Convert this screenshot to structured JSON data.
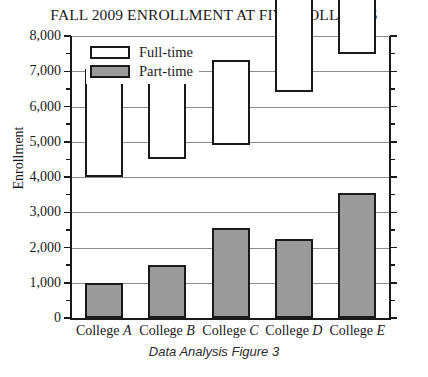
{
  "chart_data": {
    "type": "bar",
    "subtype": "stacked",
    "title": "FALL 2009 ENROLLMENT AT FIVE COLLEGES",
    "caption": "Data Analysis Figure 3",
    "xlabel": "",
    "ylabel": "Enrollment",
    "ylim": [
      0,
      8000
    ],
    "y_major_step": 1000,
    "y_minor_step": 500,
    "grid": "horizontal",
    "legend_position": "top-left inside plot",
    "categories": [
      "College A",
      "College B",
      "College C",
      "College D",
      "College E"
    ],
    "category_labels": [
      {
        "prefix": "College ",
        "italic_suffix": "A"
      },
      {
        "prefix": "College ",
        "italic_suffix": "B"
      },
      {
        "prefix": "College ",
        "italic_suffix": "C"
      },
      {
        "prefix": "College ",
        "italic_suffix": "D"
      },
      {
        "prefix": "College ",
        "italic_suffix": "E"
      }
    ],
    "series": [
      {
        "name": "Part-time",
        "color": "#9a9a9a",
        "values": [
          1000,
          1500,
          2550,
          2250,
          3550
        ]
      },
      {
        "name": "Full-time",
        "color": "#ffffff",
        "values": [
          3000,
          3000,
          2350,
          4150,
          3950
        ]
      }
    ],
    "totals": [
      4000,
      4500,
      4900,
      6400,
      7500
    ],
    "y_tick_labels": [
      "0",
      "1,000",
      "2,000",
      "3,000",
      "4,000",
      "5,000",
      "6,000",
      "7,000",
      "8,000"
    ],
    "y_tick_values": [
      0,
      1000,
      2000,
      3000,
      4000,
      5000,
      6000,
      7000,
      8000
    ]
  },
  "legend": {
    "items": [
      {
        "label": "Full-time",
        "swatch": "white-box"
      },
      {
        "label": "Part-time",
        "swatch": "gray-box"
      }
    ]
  },
  "colors": {
    "part_time_fill": "#9a9a9a",
    "full_time_fill": "#ffffff",
    "outline": "#1a1a1a",
    "gridline": "#8c8c8c",
    "background": "#ffffff"
  }
}
